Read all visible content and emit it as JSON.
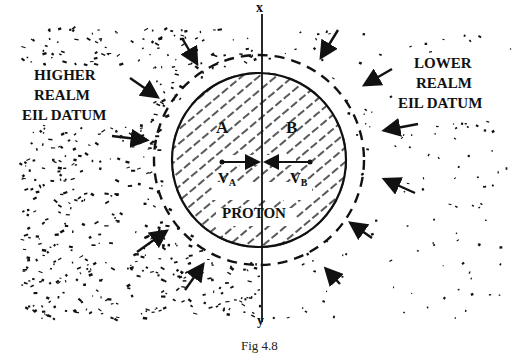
{
  "figure": {
    "caption": "Fig 4.8",
    "axis_top_label": "x",
    "axis_bottom_label": "y",
    "left_label": [
      "HIGHER",
      "REALM",
      "EIL DATUM"
    ],
    "right_label": [
      "LOWER",
      "REALM",
      "EIL DATUM"
    ],
    "region_a": "A",
    "region_b": "B",
    "velocity_a": "V",
    "velocity_a_sub": "A",
    "velocity_b": "V",
    "velocity_b_sub": "B",
    "center_label": "PROTON"
  },
  "colors": {
    "ink": "#111111",
    "background": "#ffffff"
  }
}
